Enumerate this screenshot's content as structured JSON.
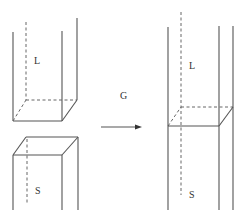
{
  "diagram": {
    "left_figure": {
      "upper_prism_label": "L",
      "lower_prism_label": "S"
    },
    "arrow": {
      "label": "G",
      "direction": "right"
    },
    "right_figure": {
      "upper_label": "L",
      "lower_label": "S"
    },
    "colors": {
      "line": "#555555",
      "text": "#333333",
      "background": "#ffffff"
    }
  }
}
